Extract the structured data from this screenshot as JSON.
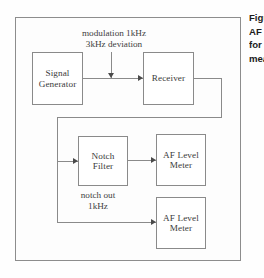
{
  "figure": {
    "title_fragment_lines": [
      "Figure",
      "AF",
      "for",
      "measurement"
    ],
    "blocks": [
      {
        "id": "signal-generator",
        "lines": [
          "Signal",
          "Generator"
        ]
      },
      {
        "id": "receiver",
        "lines": [
          "Receiver"
        ]
      },
      {
        "id": "notch-filter",
        "lines": [
          "Notch",
          "Filter"
        ]
      },
      {
        "id": "af-level-meter-1",
        "lines": [
          "AF Level",
          "Meter"
        ]
      },
      {
        "id": "af-level-meter-2",
        "lines": [
          "AF Level",
          "Meter"
        ]
      }
    ],
    "annotations": {
      "modulation_line1": "modulation 1kHz",
      "modulation_line2": "3kHz deviation",
      "notch_line1": "notch out",
      "notch_line2": "1kHz"
    },
    "colors": {
      "line": "#8a8a8a",
      "arrow": "#4a4a4a",
      "text": "#3f3f3f",
      "caption_text": "#1c1c1c",
      "background": "#fefefe"
    }
  }
}
